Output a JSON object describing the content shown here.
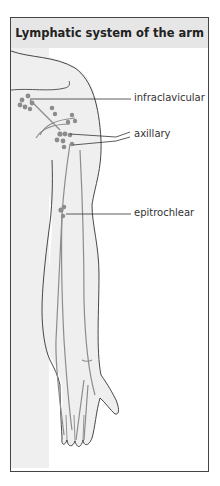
{
  "figure": {
    "title": "Lymphatic system of the arm",
    "labels": [
      {
        "id": "infraclavicular",
        "text": "infraclavicular"
      },
      {
        "id": "axillary",
        "text": "axillary"
      },
      {
        "id": "epitrochlear",
        "text": "epitrochlear"
      }
    ]
  },
  "colors": {
    "header_bg": "#e6e6e6",
    "outline": "#333333",
    "lymph": "#8c8c8c",
    "skin": "#efefef"
  }
}
